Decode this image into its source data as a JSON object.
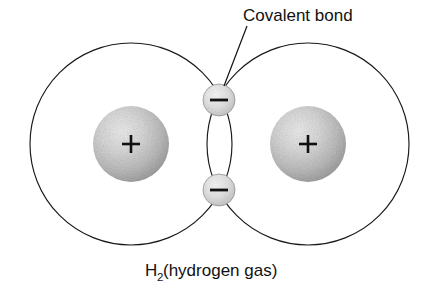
{
  "diagram": {
    "title_label": "Covalent bond",
    "caption_main": "H",
    "caption_subscript": "2",
    "caption_rest": " (hydrogen gas)",
    "caption_full": "H2 (hydrogen gas)",
    "colors": {
      "background": "#ffffff",
      "outline": "#1a1a1a",
      "text": "#111111",
      "nucleus_light": "#e8e8e8",
      "nucleus_mid": "#bcbcbc",
      "nucleus_dark": "#9a9a9a",
      "electron_light": "#f0f0f0",
      "electron_mid": "#d2d2d2",
      "electron_edge": "#8d8d8d"
    },
    "atoms": [
      {
        "name": "left-hydrogen-atom",
        "shell": {
          "cx": 131,
          "cy": 144,
          "r": 101
        },
        "nucleus": {
          "cx": 131,
          "cy": 144,
          "r": 38,
          "charge": "+"
        }
      },
      {
        "name": "right-hydrogen-atom",
        "shell": {
          "cx": 308,
          "cy": 144,
          "r": 101
        },
        "nucleus": {
          "cx": 308,
          "cy": 144,
          "r": 38,
          "charge": "+"
        }
      }
    ],
    "electrons": [
      {
        "name": "top-shared-electron",
        "cx": 219,
        "cy": 100,
        "r": 16,
        "charge": "−"
      },
      {
        "name": "bottom-shared-electron",
        "cx": 219,
        "cy": 190,
        "r": 16,
        "charge": "−"
      }
    ],
    "leader": {
      "name": "covalent-bond-leader-line",
      "x1": 247,
      "y1": 26,
      "x2": 224,
      "y2": 86
    },
    "label_position": {
      "x": 243,
      "y": 21
    },
    "caption_position": {
      "x": 145,
      "y": 276
    }
  }
}
